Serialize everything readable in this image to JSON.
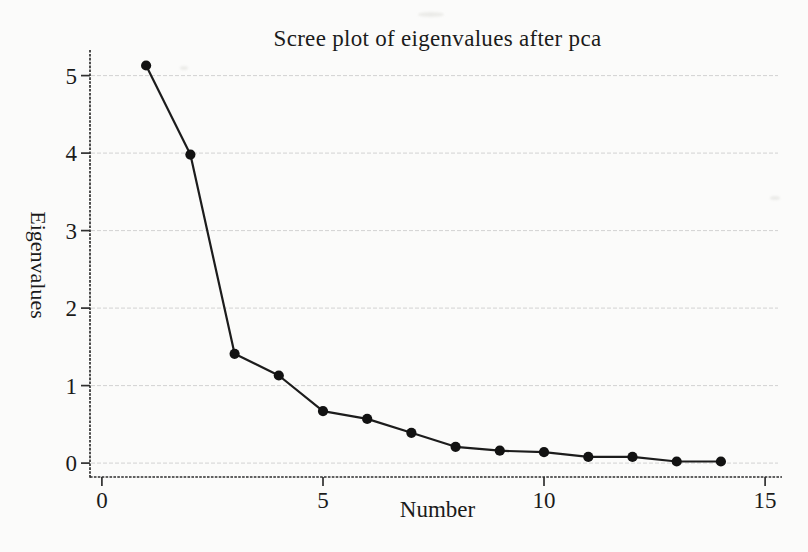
{
  "page": {
    "background_color": "#fbfbfa",
    "text_color": "#1b1b1b"
  },
  "chart_data": {
    "type": "line",
    "title": "Scree plot of eigenvalues after pca",
    "xlabel": "Number",
    "ylabel": "Eigenvalues",
    "x": [
      1,
      2,
      3,
      4,
      5,
      6,
      7,
      8,
      9,
      10,
      11,
      12,
      13,
      14
    ],
    "values": [
      5.13,
      3.98,
      1.41,
      1.13,
      0.67,
      0.57,
      0.39,
      0.21,
      0.16,
      0.14,
      0.08,
      0.08,
      0.02,
      0.02
    ],
    "xticks": [
      0,
      5,
      10,
      15
    ],
    "yticks": [
      0,
      1,
      2,
      3,
      4,
      5
    ],
    "xlim": [
      -0.27,
      15.45
    ],
    "ylim": [
      -0.18,
      5.33
    ],
    "grid": "horizontal-only",
    "legend": "none",
    "marker": "filled-circle",
    "line_color": "#1c1c1c",
    "marker_color": "#121212",
    "axis_color": "#2f2f2f",
    "grid_color": "#cccccc"
  }
}
